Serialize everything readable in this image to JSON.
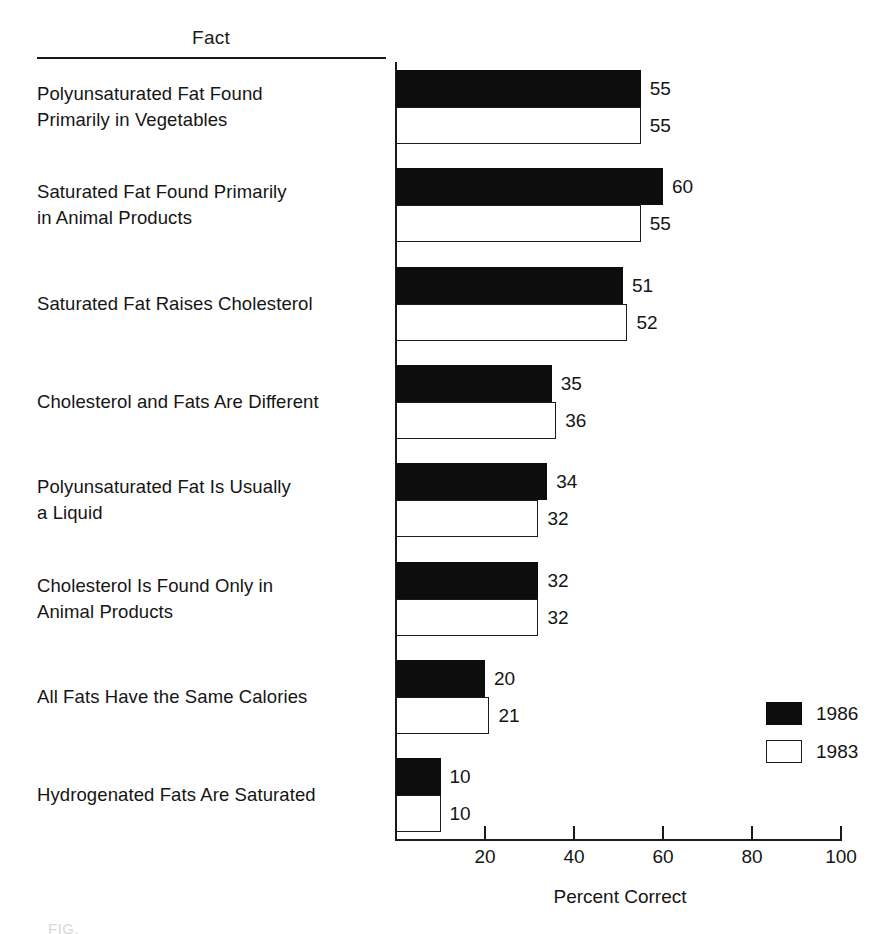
{
  "header": {
    "column_title": "Fact"
  },
  "axis": {
    "title": "Percent Correct",
    "ticks": [
      20,
      40,
      60,
      80,
      100
    ],
    "tick_labels": [
      "20",
      "40",
      "60",
      "80",
      "100"
    ],
    "min": 0,
    "max": 100
  },
  "legend": {
    "position": "bottom-right",
    "entries": [
      {
        "label": "1986",
        "style": "dark",
        "color": "#0d0d0d"
      },
      {
        "label": "1983",
        "style": "light",
        "color": "#ffffff"
      }
    ]
  },
  "caption_fragment": "FIG.",
  "rows": [
    {
      "label": "Polyunsaturated Fat Found\nPrimarily in Vegetables",
      "v1986": 55,
      "v1983": 55,
      "v1986_text": "55",
      "v1983_text": "55"
    },
    {
      "label": "Saturated Fat Found Primarily\nin Animal Products",
      "v1986": 60,
      "v1983": 55,
      "v1986_text": "60",
      "v1983_text": "55"
    },
    {
      "label": "Saturated Fat Raises Cholesterol",
      "v1986": 51,
      "v1983": 52,
      "v1986_text": "51",
      "v1983_text": "52"
    },
    {
      "label": "Cholesterol and Fats Are Different",
      "v1986": 35,
      "v1983": 36,
      "v1986_text": "35",
      "v1983_text": "36"
    },
    {
      "label": "Polyunsaturated Fat Is Usually\na Liquid",
      "v1986": 34,
      "v1983": 32,
      "v1986_text": "34",
      "v1983_text": "32"
    },
    {
      "label": "Cholesterol Is Found Only in\nAnimal Products",
      "v1986": 32,
      "v1983": 32,
      "v1986_text": "32",
      "v1983_text": "32"
    },
    {
      "label": "All Fats Have the Same Calories",
      "v1986": 20,
      "v1983": 21,
      "v1986_text": "20",
      "v1983_text": "21"
    },
    {
      "label": "Hydrogenated Fats Are Saturated",
      "v1986": 10,
      "v1983": 10,
      "v1986_text": "10",
      "v1983_text": "10"
    }
  ],
  "chart_data": {
    "type": "bar",
    "orientation": "horizontal",
    "title": "",
    "xlabel": "Percent Correct",
    "ylabel": "Fact",
    "xlim": [
      0,
      100
    ],
    "xticks": [
      20,
      40,
      60,
      80,
      100
    ],
    "grid": false,
    "legend_position": "bottom-right",
    "categories": [
      "Polyunsaturated Fat Found Primarily in Vegetables",
      "Saturated Fat Found Primarily in Animal Products",
      "Saturated Fat Raises Cholesterol",
      "Cholesterol and Fats Are Different",
      "Polyunsaturated Fat Is Usually a Liquid",
      "Cholesterol Is Found Only in Animal Products",
      "All Fats Have the Same Calories",
      "Hydrogenated Fats Are Saturated"
    ],
    "series": [
      {
        "name": "1986",
        "color": "#0d0d0d",
        "values": [
          55,
          60,
          51,
          35,
          34,
          32,
          20,
          10
        ]
      },
      {
        "name": "1983",
        "color": "#ffffff",
        "values": [
          55,
          55,
          52,
          36,
          32,
          32,
          21,
          10
        ]
      }
    ]
  }
}
